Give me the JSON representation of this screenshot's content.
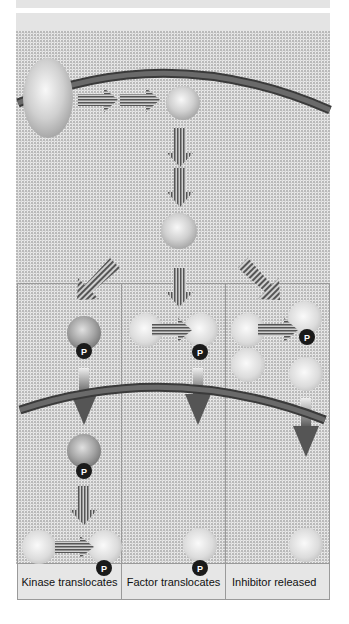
{
  "diagram": {
    "type": "signal-transduction-pathway",
    "phospho_label": "P",
    "columns": [
      {
        "id": "kinase",
        "label": "Kinase translocates"
      },
      {
        "id": "factor",
        "label": "Factor translocates"
      },
      {
        "id": "inhibitor",
        "label": "Inhibitor released"
      }
    ],
    "colors": {
      "background": "#ececec",
      "band": "#e4e4e4",
      "membrane": "#4a4a4a",
      "phospho_badge": "#1a1a1a",
      "label_bg": "#e6e6e6",
      "border": "#9a9a9a"
    }
  }
}
